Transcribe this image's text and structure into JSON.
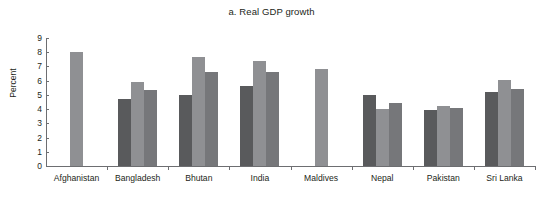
{
  "chart_data": {
    "type": "bar",
    "title": "a. Real GDP growth",
    "xlabel": "",
    "ylabel": "Percent",
    "ylim": [
      0,
      9
    ],
    "ytick_step": 1,
    "yticks": [
      "0",
      "1",
      "2",
      "3",
      "4",
      "5",
      "6",
      "7",
      "8",
      "9"
    ],
    "grid": false,
    "legend": "none",
    "categories": [
      "Afghanistan",
      "Bangladesh",
      "Bhutan",
      "India",
      "Maldives",
      "Nepal",
      "Pakistan",
      "Sri Lanka"
    ],
    "series": [
      {
        "name": "series-1",
        "color": "#595a5c",
        "values": [
          null,
          4.7,
          5.0,
          5.6,
          null,
          5.0,
          3.95,
          5.2
        ]
      },
      {
        "name": "series-2",
        "color": "#8f9093",
        "values": [
          8.0,
          5.9,
          7.7,
          7.4,
          6.85,
          4.0,
          4.2,
          6.05
        ]
      },
      {
        "name": "series-3",
        "color": "#76777a",
        "values": [
          null,
          5.35,
          6.6,
          6.6,
          null,
          4.45,
          4.1,
          5.4
        ]
      }
    ]
  }
}
